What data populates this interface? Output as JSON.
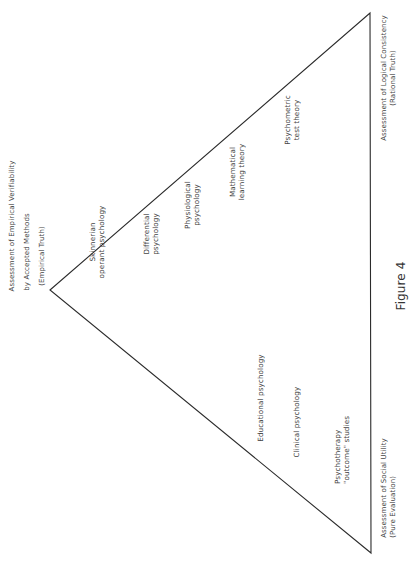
{
  "figure": {
    "caption": "Figure 4",
    "shape": "triangle",
    "line_color": "#2b2b2b"
  },
  "vertices": {
    "empirical": {
      "line1": "Assessment of Empirical Verifiability",
      "line2": "by Accepted Methods",
      "line3": "(Empirical Truth)"
    },
    "rational": {
      "line1": "Assessment of Logical Consistency",
      "line2": "(Rational Truth)"
    },
    "evaluation": {
      "line1": "Assessment of Social Utility",
      "line2": "(Pure Evaluation)"
    }
  },
  "fields": [
    {
      "line1": "Skinnerian",
      "line2": "operant psychology"
    },
    {
      "line1": "Differential",
      "line2": "psychology"
    },
    {
      "line1": "Physiological",
      "line2": "psychology"
    },
    {
      "line1": "Mathematical",
      "line2": "learning theory"
    },
    {
      "line1": "Psychometric",
      "line2": "test theory"
    },
    {
      "line1": "Educational psychology"
    },
    {
      "line1": "Clinical psychology"
    },
    {
      "line1": "Psychotherapy",
      "line2": "\"outcome\" studies"
    }
  ]
}
